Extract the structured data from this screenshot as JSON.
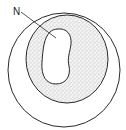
{
  "diagram": {
    "labels": [
      {
        "id": "nucleus",
        "text": "N"
      }
    ],
    "colors": {
      "stroke": "#2a2a2a",
      "background": "#ffffff",
      "stipple": "#9a9a9a"
    }
  }
}
